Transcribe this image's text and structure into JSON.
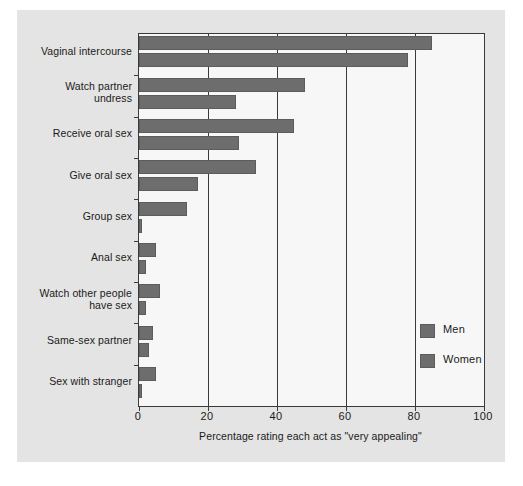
{
  "chart_data": {
    "type": "bar",
    "orientation": "horizontal",
    "title": "",
    "xlabel": "Percentage rating each act as \"very appealing\"",
    "ylabel": "",
    "xlim": [
      0,
      100
    ],
    "xticks": [
      0,
      20,
      40,
      60,
      80,
      100
    ],
    "xticklabels": [
      "0",
      "20",
      "40",
      "60",
      "80",
      "100"
    ],
    "grid": "vertical",
    "legend_position": "lower right",
    "categories": [
      "Vaginal intercourse",
      "Watch partner undress",
      "Receive oral sex",
      "Give oral sex",
      "Group sex",
      "Anal sex",
      "Watch other people have sex",
      "Same-sex partner",
      "Sex with stranger"
    ],
    "category_lines": [
      [
        "Vaginal intercourse"
      ],
      [
        "Watch partner",
        "undress"
      ],
      [
        "Receive oral sex"
      ],
      [
        "Give oral sex"
      ],
      [
        "Group sex"
      ],
      [
        "Anal sex"
      ],
      [
        "Watch other people",
        "have sex"
      ],
      [
        "Same-sex partner"
      ],
      [
        "Sex with stranger"
      ]
    ],
    "series": [
      {
        "name": "Men",
        "color": "#6d6d6d",
        "values": [
          85,
          48,
          45,
          34,
          14,
          5,
          6,
          4,
          5
        ]
      },
      {
        "name": "Women",
        "color": "#6d6d6d",
        "values": [
          78,
          28,
          29,
          17,
          1,
          2,
          2,
          3,
          1
        ]
      }
    ]
  },
  "legend": {
    "items": [
      {
        "label": "Men",
        "color": "#6d6d6d"
      },
      {
        "label": "Women",
        "color": "#6d6d6d"
      }
    ]
  },
  "colors": {
    "bar": "#6d6d6d",
    "bar_edge": "#5c5c5c",
    "axis": "#3a3a3a",
    "card_background": "#e4e4e4",
    "plot_background": "#f7f7f7",
    "text": "#1a1a1a"
  }
}
